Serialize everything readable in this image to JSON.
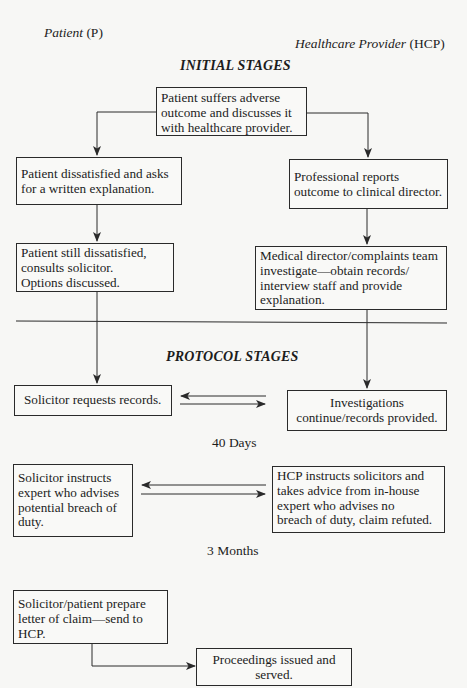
{
  "header": {
    "left_label_italic": "Patient",
    "left_label_abbr": " (P)",
    "right_label_italic": "Healthcare Provider",
    "right_label_abbr": " (HCP)"
  },
  "stages": {
    "initial": "INITIAL STAGES",
    "protocol": "PROTOCOL STAGES"
  },
  "nodes": {
    "start": "Patient suffers adverse\noutcome and discusses it\nwith healthcare provider.",
    "patient_written": "Patient dissatisfied and asks\nfor a written explanation.",
    "hcp_report": "Professional reports\noutcome to clinical director.",
    "patient_solicitor": "Patient still dissatisfied,\nconsults solicitor.\nOptions discussed.",
    "hcp_investigate": "Medical director/complaints team\ninvestigate—obtain records/\ninterview staff and provide\nexplanation.",
    "solicitor_requests": "Solicitor requests records.",
    "hcp_records": "Investigations\ncontinue/records provided.",
    "solicitor_expert": "Solicitor instructs\nexpert who advises\npotential breach of\nduty.",
    "hcp_expert": "HCP instructs solicitors and\ntakes advice from in-house\nexpert who advises no\nbreach of duty, claim refuted.",
    "letter_of_claim": "Solicitor/patient prepare\nletter of claim—send to\nHCP.",
    "proceedings": "Proceedings issued and\nserved."
  },
  "timings": {
    "first": "40 Days",
    "second": "3 Months"
  },
  "colors": {
    "line": "#2a2a2a",
    "background": "#f7f7f5"
  }
}
